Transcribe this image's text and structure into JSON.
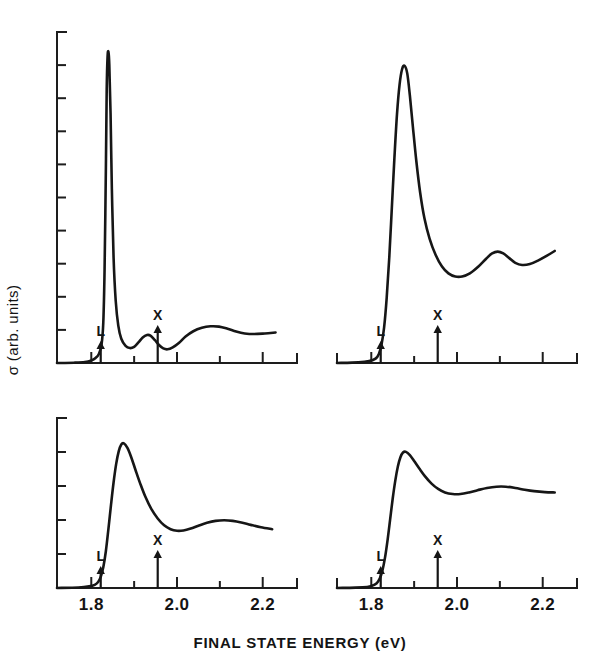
{
  "figure": {
    "background_color": "#ffffff",
    "ink_color": "#161616",
    "xlabel": "FINAL STATE ENERGY (eV)",
    "ylabel": "σ (arb. units)"
  },
  "chart_data": {
    "type": "line",
    "title": "",
    "subtitle": "",
    "xlabel": "FINAL STATE ENERGY (eV)",
    "ylabel": "σ (arb. units)",
    "xlim": [
      1.72,
      2.28
    ],
    "ylim": [
      0,
      1.0
    ],
    "grid": false,
    "legend": "none",
    "xticks": [
      1.7,
      1.8,
      1.9,
      2.0,
      2.1,
      2.2
    ],
    "xticklabels": [
      "",
      "1.8",
      "",
      "2.0",
      "",
      "2.2"
    ],
    "xticklabels_shown": [
      "1.8",
      "2.0",
      "2.2"
    ],
    "yticks_count": 9,
    "yticklabels": [],
    "annotations": [
      {
        "label": "L",
        "x": 1.815,
        "description": "L critical point arrow"
      },
      {
        "label": "X",
        "x": 1.955,
        "description": "X critical point arrow"
      }
    ],
    "panels": [
      {
        "id": "panel-top-left",
        "position": "top-left",
        "has_y_axis": true,
        "y_tick_count": 9,
        "x_axis_range": [
          1.72,
          2.235
        ],
        "annotations": [
          {
            "label": "L",
            "x": 1.822,
            "arrow_height_px": 22
          },
          {
            "label": "X",
            "x": 1.955,
            "arrow_height_px": 38
          }
        ],
        "series": [
          {
            "name": "spectrum-a",
            "points": [
              [
                1.72,
                0.0
              ],
              [
                1.76,
                0.001
              ],
              [
                1.785,
                0.003
              ],
              [
                1.8,
                0.008
              ],
              [
                1.81,
                0.016
              ],
              [
                1.818,
                0.03
              ],
              [
                1.824,
                0.06
              ],
              [
                1.828,
                0.13
              ],
              [
                1.831,
                0.3
              ],
              [
                1.834,
                0.62
              ],
              [
                1.836,
                0.88
              ],
              [
                1.838,
                0.985
              ],
              [
                1.84,
                1.0
              ],
              [
                1.842,
                0.96
              ],
              [
                1.845,
                0.8
              ],
              [
                1.848,
                0.56
              ],
              [
                1.852,
                0.34
              ],
              [
                1.857,
                0.2
              ],
              [
                1.863,
                0.12
              ],
              [
                1.87,
                0.078
              ],
              [
                1.88,
                0.055
              ],
              [
                1.89,
                0.048
              ],
              [
                1.9,
                0.052
              ],
              [
                1.91,
                0.066
              ],
              [
                1.92,
                0.082
              ],
              [
                1.93,
                0.09
              ],
              [
                1.938,
                0.088
              ],
              [
                1.948,
                0.074
              ],
              [
                1.958,
                0.058
              ],
              [
                1.968,
                0.047
              ],
              [
                1.978,
                0.044
              ],
              [
                1.99,
                0.05
              ],
              [
                2.005,
                0.065
              ],
              [
                2.02,
                0.085
              ],
              [
                2.038,
                0.102
              ],
              [
                2.058,
                0.113
              ],
              [
                2.078,
                0.118
              ],
              [
                2.098,
                0.117
              ],
              [
                2.118,
                0.11
              ],
              [
                2.138,
                0.101
              ],
              [
                2.158,
                0.095
              ],
              [
                2.18,
                0.093
              ],
              [
                2.205,
                0.095
              ],
              [
                2.23,
                0.098
              ]
            ]
          }
        ]
      },
      {
        "id": "panel-top-right",
        "position": "top-right",
        "has_y_axis": false,
        "y_tick_count": 0,
        "x_axis_range": [
          1.72,
          2.235
        ],
        "annotations": [
          {
            "label": "L",
            "x": 1.822,
            "arrow_height_px": 22
          },
          {
            "label": "X",
            "x": 1.955,
            "arrow_height_px": 38
          }
        ],
        "series": [
          {
            "name": "spectrum-b",
            "points": [
              [
                1.72,
                0.0
              ],
              [
                1.77,
                0.002
              ],
              [
                1.795,
                0.006
              ],
              [
                1.81,
                0.014
              ],
              [
                1.818,
                0.03
              ],
              [
                1.824,
                0.06
              ],
              [
                1.83,
                0.115
              ],
              [
                1.836,
                0.21
              ],
              [
                1.842,
                0.34
              ],
              [
                1.848,
                0.5
              ],
              [
                1.854,
                0.66
              ],
              [
                1.86,
                0.8
              ],
              [
                1.866,
                0.895
              ],
              [
                1.872,
                0.945
              ],
              [
                1.878,
                0.955
              ],
              [
                1.884,
                0.93
              ],
              [
                1.89,
                0.86
              ],
              [
                1.897,
                0.76
              ],
              [
                1.905,
                0.65
              ],
              [
                1.914,
                0.548
              ],
              [
                1.924,
                0.465
              ],
              [
                1.936,
                0.4
              ],
              [
                1.95,
                0.348
              ],
              [
                1.965,
                0.31
              ],
              [
                1.98,
                0.288
              ],
              [
                1.996,
                0.278
              ],
              [
                2.012,
                0.278
              ],
              [
                2.03,
                0.288
              ],
              [
                2.05,
                0.31
              ],
              [
                2.068,
                0.335
              ],
              [
                2.082,
                0.352
              ],
              [
                2.095,
                0.358
              ],
              [
                2.108,
                0.352
              ],
              [
                2.122,
                0.337
              ],
              [
                2.136,
                0.322
              ],
              [
                2.152,
                0.315
              ],
              [
                2.17,
                0.318
              ],
              [
                2.19,
                0.33
              ],
              [
                2.21,
                0.345
              ],
              [
                2.228,
                0.36
              ]
            ]
          }
        ]
      },
      {
        "id": "panel-bottom-left",
        "position": "bottom-left",
        "has_y_axis": true,
        "y_tick_count": 4,
        "x_axis_range": [
          1.72,
          2.235
        ],
        "annotations": [
          {
            "label": "L",
            "x": 1.822,
            "arrow_height_px": 22
          },
          {
            "label": "X",
            "x": 1.955,
            "arrow_height_px": 38
          }
        ],
        "series": [
          {
            "name": "spectrum-c",
            "points": [
              [
                1.72,
                0.0
              ],
              [
                1.77,
                0.003
              ],
              [
                1.795,
                0.01
              ],
              [
                1.808,
                0.02
              ],
              [
                1.816,
                0.038
              ],
              [
                1.822,
                0.07
              ],
              [
                1.828,
                0.13
              ],
              [
                1.834,
                0.23
              ],
              [
                1.84,
                0.37
              ],
              [
                1.846,
                0.52
              ],
              [
                1.852,
                0.66
              ],
              [
                1.858,
                0.775
              ],
              [
                1.864,
                0.855
              ],
              [
                1.87,
                0.898
              ],
              [
                1.876,
                0.905
              ],
              [
                1.884,
                0.878
              ],
              [
                1.893,
                0.82
              ],
              [
                1.903,
                0.74
              ],
              [
                1.914,
                0.655
              ],
              [
                1.926,
                0.572
              ],
              [
                1.94,
                0.495
              ],
              [
                1.955,
                0.435
              ],
              [
                1.97,
                0.392
              ],
              [
                1.985,
                0.368
              ],
              [
                2.0,
                0.358
              ],
              [
                2.015,
                0.36
              ],
              [
                2.032,
                0.372
              ],
              [
                2.05,
                0.39
              ],
              [
                2.07,
                0.408
              ],
              [
                2.09,
                0.42
              ],
              [
                2.11,
                0.424
              ],
              [
                2.13,
                0.42
              ],
              [
                2.15,
                0.41
              ],
              [
                2.172,
                0.395
              ],
              [
                2.196,
                0.38
              ],
              [
                2.222,
                0.368
              ]
            ]
          }
        ]
      },
      {
        "id": "panel-bottom-right",
        "position": "bottom-right",
        "has_y_axis": false,
        "y_tick_count": 0,
        "x_axis_range": [
          1.72,
          2.235
        ],
        "annotations": [
          {
            "label": "L",
            "x": 1.822,
            "arrow_height_px": 22
          },
          {
            "label": "X",
            "x": 1.955,
            "arrow_height_px": 38
          }
        ],
        "series": [
          {
            "name": "spectrum-d",
            "points": [
              [
                1.72,
                0.0
              ],
              [
                1.78,
                0.004
              ],
              [
                1.8,
                0.012
              ],
              [
                1.812,
                0.028
              ],
              [
                1.82,
                0.06
              ],
              [
                1.826,
                0.11
              ],
              [
                1.832,
                0.19
              ],
              [
                1.838,
                0.3
              ],
              [
                1.844,
                0.43
              ],
              [
                1.85,
                0.56
              ],
              [
                1.856,
                0.672
              ],
              [
                1.862,
                0.76
              ],
              [
                1.868,
                0.818
              ],
              [
                1.874,
                0.848
              ],
              [
                1.881,
                0.852
              ],
              [
                1.89,
                0.832
              ],
              [
                1.9,
                0.795
              ],
              [
                1.912,
                0.748
              ],
              [
                1.925,
                0.7
              ],
              [
                1.94,
                0.655
              ],
              [
                1.956,
                0.62
              ],
              [
                1.972,
                0.598
              ],
              [
                1.99,
                0.588
              ],
              [
                2.008,
                0.588
              ],
              [
                2.028,
                0.598
              ],
              [
                2.048,
                0.612
              ],
              [
                2.07,
                0.626
              ],
              [
                2.092,
                0.634
              ],
              [
                2.114,
                0.634
              ],
              [
                2.136,
                0.626
              ],
              [
                2.158,
                0.615
              ],
              [
                2.18,
                0.606
              ],
              [
                2.205,
                0.6
              ],
              [
                2.228,
                0.598
              ]
            ]
          }
        ]
      }
    ]
  }
}
